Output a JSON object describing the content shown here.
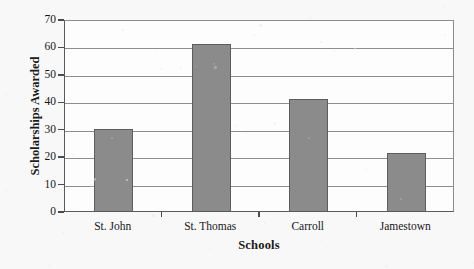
{
  "chart_data": {
    "type": "bar",
    "title": "",
    "xlabel": "Schools",
    "ylabel": "Scholarships Awarded",
    "categories": [
      "St. John",
      "St. Thomas",
      "Carroll",
      "Jamestown"
    ],
    "values": [
      30,
      61,
      41,
      21
    ],
    "ylim": [
      0,
      70
    ],
    "yticks": [
      0,
      10,
      20,
      30,
      40,
      50,
      60,
      70
    ],
    "ytick_labels": [
      "0",
      "10",
      "20",
      "30",
      "40",
      "50",
      "60",
      "70"
    ],
    "grid": true,
    "grid_axis": "y",
    "legend": null,
    "bar_color": "#8b8b8b",
    "bar_edge_color": "#5d5d5d",
    "axis_color": "#4a4a4a",
    "plot_background": "#fdfdfd",
    "page_background": "#f8f8f8"
  }
}
